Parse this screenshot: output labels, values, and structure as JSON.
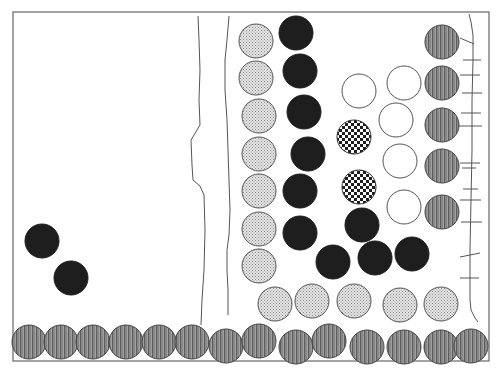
{
  "game": {
    "title": "Marble board",
    "piece_types": {
      "black": {
        "fill": "#1e1e1e",
        "stroke": "#1e1e1e"
      },
      "dotted": {
        "fill": "#d9d9d9",
        "stroke": "#555555"
      },
      "striped": {
        "fill": "#8a8a8a",
        "stroke": "#444444"
      },
      "checkered": {
        "fill": "#ffffff",
        "stroke": "#333333"
      },
      "empty": {
        "fill": "#ffffff",
        "stroke": "#555555"
      }
    },
    "colors": {
      "frame": "#666666",
      "line": "#555555",
      "background": "#ffffff"
    }
  }
}
